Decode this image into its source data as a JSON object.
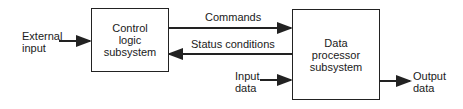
{
  "diagram": {
    "blocks": [
      {
        "id": "control",
        "label": "Control\nlogic\nsubsystem"
      },
      {
        "id": "data",
        "label": "Data\nprocessor\nsubsystem"
      }
    ],
    "labels": {
      "external_input": "External\ninput",
      "commands": "Commands",
      "status": "Status conditions",
      "input_data": "Input\ndata",
      "output_data": "Output\ndata"
    },
    "edges": [
      {
        "from": "external input",
        "to": "control",
        "label": "External input"
      },
      {
        "from": "control",
        "to": "data",
        "label": "Commands"
      },
      {
        "from": "data",
        "to": "control",
        "label": "Status conditions"
      },
      {
        "from": "input data",
        "to": "data",
        "label": "Input data"
      },
      {
        "from": "data",
        "to": "output data",
        "label": "Output data"
      }
    ]
  }
}
